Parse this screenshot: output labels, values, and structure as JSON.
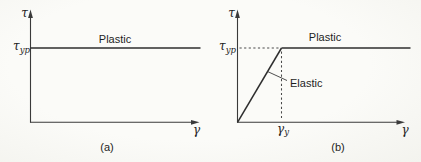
{
  "colors": {
    "background": "#fafaf7",
    "line": "#2e2e2e",
    "text": "#1e1e1e"
  },
  "panels": {
    "a": {
      "caption": "(a)",
      "y_axis_label": "τ",
      "x_axis_label": "γ",
      "yield_stress_symbol": "τ",
      "yield_stress_subscript": "yp",
      "plastic_label": "Plastic"
    },
    "b": {
      "caption": "(b)",
      "y_axis_label": "τ",
      "x_axis_label": "γ",
      "yield_stress_symbol": "τ",
      "yield_stress_subscript": "yp",
      "yield_strain_symbol": "γ",
      "yield_strain_subscript": "y",
      "plastic_label": "Plastic",
      "elastic_label": "Elastic"
    }
  }
}
